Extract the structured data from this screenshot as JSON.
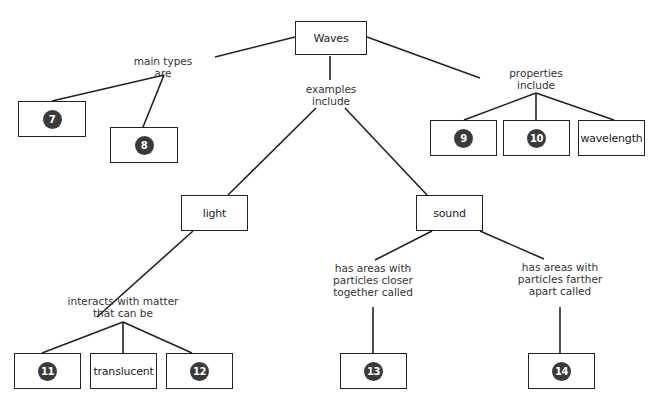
{
  "diagram": {
    "type": "concept-map",
    "root": {
      "label": "Waves"
    },
    "links": {
      "main_types": "main types\nare",
      "examples": "examples\ninclude",
      "properties": "properties\ninclude",
      "light_matter": "interacts with matter\nthat can be",
      "closer": "has areas with\nparticles closer\ntogether called",
      "farther": "has areas with\nparticles farther\napart called"
    },
    "nodes": {
      "n7": {
        "badge": "7"
      },
      "n8": {
        "badge": "8"
      },
      "n9": {
        "badge": "9"
      },
      "n10": {
        "badge": "10"
      },
      "wavelength": {
        "label": "wavelength"
      },
      "light": {
        "label": "light"
      },
      "sound": {
        "label": "sound"
      },
      "n11": {
        "badge": "11"
      },
      "translucent": {
        "label": "translucent"
      },
      "n12": {
        "badge": "12"
      },
      "n13": {
        "badge": "13"
      },
      "n14": {
        "badge": "14"
      }
    }
  }
}
